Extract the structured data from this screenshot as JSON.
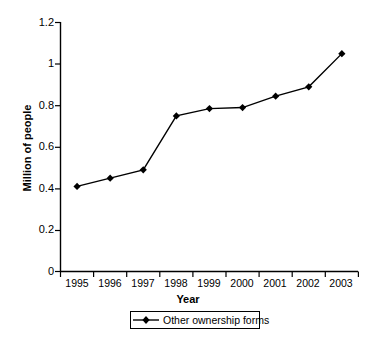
{
  "chart_data": {
    "type": "line",
    "title": "",
    "xlabel": "Year",
    "ylabel": "Million of people",
    "categories": [
      "1995",
      "1996",
      "1997",
      "1998",
      "1999",
      "2000",
      "2001",
      "2002",
      "2003"
    ],
    "series": [
      {
        "name": "Other ownership forms",
        "values": [
          0.41,
          0.45,
          0.49,
          0.75,
          0.785,
          0.79,
          0.845,
          0.89,
          1.05
        ],
        "color": "#000000",
        "marker": "diamond"
      }
    ],
    "ylim": [
      0,
      1.2
    ],
    "yticks": [
      "0",
      "0.2",
      "0.4",
      "0.6",
      "0.8",
      "1",
      "1.2"
    ],
    "ytick_values": [
      0,
      0.2,
      0.4,
      0.6,
      0.8,
      1,
      1.2
    ],
    "grid": false,
    "legend_position": "bottom"
  },
  "legend": {
    "entries": [
      {
        "label": "Other ownership forms",
        "marker": "diamond-marker-icon"
      }
    ]
  },
  "axes": {
    "y_title": "Million of people",
    "x_title": "Year"
  },
  "colors": {
    "line": "#000000",
    "axis": "#000000",
    "background": "#ffffff"
  }
}
